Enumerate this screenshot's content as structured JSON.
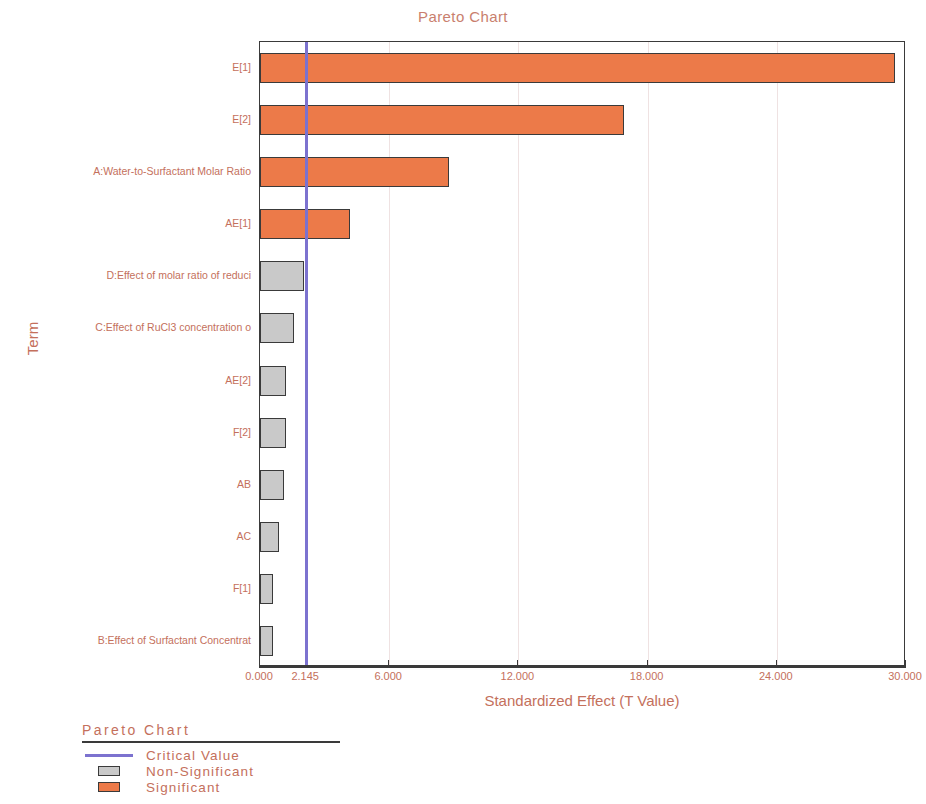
{
  "chart_data": {
    "type": "bar",
    "orientation": "horizontal",
    "title": "Pareto Chart",
    "xlabel": "Standardized Effect (T Value)",
    "ylabel": "Term",
    "xlim": [
      0,
      30
    ],
    "xticks": [
      0,
      2.145,
      6,
      12,
      18,
      24,
      30
    ],
    "xtick_labels": [
      "0.000",
      "2.145",
      "6.000",
      "12.000",
      "18.000",
      "24.000",
      "30.000"
    ],
    "grid": true,
    "grid_axis": "x",
    "categories": [
      "E[1]",
      "E[2]",
      "A:Water-to-Surfactant Molar Ratio",
      "AE[1]",
      "D:Effect of molar ratio of reduci",
      "C:Effect of RuCl3 concentration o",
      "AE[2]",
      "F[2]",
      "AB",
      "AC",
      "F[1]",
      "B:Effect of Surfactant Concentrat"
    ],
    "values": [
      29.5,
      16.9,
      8.8,
      4.2,
      2.05,
      1.58,
      1.22,
      1.2,
      1.1,
      0.88,
      0.62,
      0.6
    ],
    "significance": [
      "significant",
      "significant",
      "significant",
      "significant",
      "non-significant",
      "non-significant",
      "non-significant",
      "non-significant",
      "non-significant",
      "non-significant",
      "non-significant",
      "non-significant"
    ],
    "critical_value": 2.145,
    "colors": {
      "significant": "#ec7a49",
      "non_significant": "#c9c9c9",
      "critical_line": "#7c72cf",
      "text": "#c4705c",
      "axis": "#3a3a3a",
      "gridline": "#efe2e2"
    },
    "legend": {
      "title": "Pareto Chart",
      "position": "below-left",
      "entries": [
        {
          "label": "Critical Value",
          "marker": "line",
          "color": "#7c72cf"
        },
        {
          "label": "Non-Significant",
          "marker": "box",
          "color": "#c9c9c9"
        },
        {
          "label": "Significant",
          "marker": "box",
          "color": "#ec7a49"
        }
      ]
    }
  }
}
